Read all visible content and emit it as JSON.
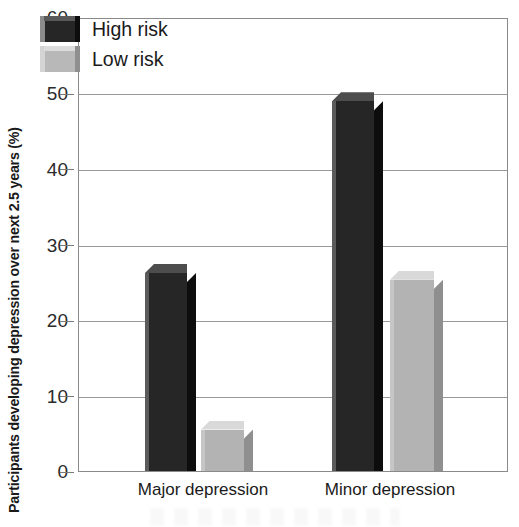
{
  "chart_data": {
    "type": "bar",
    "title": "",
    "xlabel": "",
    "ylabel": "Participants developing depression over next 2.5 years (%)",
    "categories": [
      "Major depression",
      "Minor depression"
    ],
    "series": [
      {
        "name": "High risk",
        "color": "#262626",
        "values": [
          26.3,
          49.1
        ]
      },
      {
        "name": "Low risk",
        "color": "#b3b3b3",
        "values": [
          5.5,
          25.4
        ]
      }
    ],
    "ylim": [
      0,
      60
    ],
    "yticks": [
      0,
      10,
      20,
      30,
      40,
      50,
      60
    ],
    "ytick_labels": [
      "0",
      "10",
      "20",
      "30",
      "40",
      "50",
      "60"
    ],
    "grid": true,
    "grid_axis": "y",
    "legend_position": "top-left",
    "style": "3d-extruded-bars"
  },
  "axis": {
    "y_title": "Participants developing depression over next 2.5 years (%)",
    "tick_0": "0",
    "tick_10": "10",
    "tick_20": "20",
    "tick_30": "30",
    "tick_40": "40",
    "tick_50": "50",
    "tick_60": "60"
  },
  "legend": {
    "items": [
      {
        "label": "High risk"
      },
      {
        "label": "Low risk"
      }
    ]
  },
  "categories": [
    {
      "label": "Major depression"
    },
    {
      "label": "Minor depression"
    }
  ]
}
